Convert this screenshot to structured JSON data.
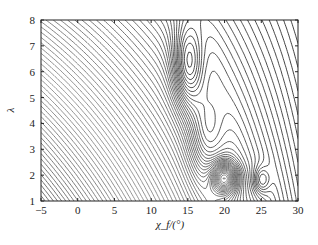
{
  "chart_data": {
    "type": "contour",
    "title": "",
    "xlabel": "χ_f/(°)",
    "ylabel": "λ",
    "xlim": [
      -5,
      30
    ],
    "ylim": [
      1,
      8
    ],
    "xticks": [
      -5,
      0,
      5,
      10,
      15,
      20,
      25,
      30
    ],
    "yticks": [
      1,
      2,
      3,
      4,
      5,
      6,
      7,
      8
    ],
    "xtick_labels": [
      "−5",
      "0",
      "5",
      "10",
      "15",
      "20",
      "25",
      "30"
    ],
    "ytick_labels": [
      "1",
      "2",
      "3",
      "4",
      "5",
      "6",
      "7",
      "8"
    ],
    "grid": false,
    "legend": "none",
    "line_color_gradient": {
      "low": "#b8b8b8",
      "high": "#111111"
    },
    "features": [
      {
        "kind": "maximum",
        "label": "elongated closed contour",
        "x": 15,
        "y": 6.2
      },
      {
        "kind": "minimum",
        "label": "dense closed contours",
        "x": 20,
        "y": 1.9
      },
      {
        "kind": "local",
        "label": "small closed contour",
        "x": 25,
        "y": 1.8
      }
    ]
  }
}
